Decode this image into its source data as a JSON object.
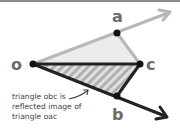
{
  "diagram": {
    "colors": {
      "background": "#ffffff",
      "top_bar": "#8a8a8a",
      "light_line": "#b8b8b8",
      "dark_line": "#222222",
      "upper_fill": "#ececec",
      "hatch_light": "#e0e0e0",
      "hatch_dark": "#b0b0b0",
      "label": "#6b6b6b",
      "caption": "#444444"
    },
    "points": [
      {
        "id": "o",
        "label": "o",
        "x": 33,
        "y": 64
      },
      {
        "id": "a",
        "label": "a",
        "x": 117,
        "y": 33
      },
      {
        "id": "c",
        "label": "c",
        "x": 140,
        "y": 64
      },
      {
        "id": "b",
        "label": "b",
        "x": 117,
        "y": 96
      }
    ],
    "rays": [
      {
        "id": "ray-oa",
        "from": "o",
        "through": "a",
        "tip": [
          170,
          12
        ],
        "style": "light"
      },
      {
        "id": "ray-ob",
        "from": "o",
        "through": "b",
        "tip": [
          167,
          117
        ],
        "style": "dark"
      }
    ],
    "triangles": [
      {
        "id": "oac",
        "vertices": [
          "o",
          "a",
          "c"
        ],
        "fill": "solid-light"
      },
      {
        "id": "obc",
        "vertices": [
          "o",
          "b",
          "c"
        ],
        "fill": "hatched"
      }
    ],
    "caption": {
      "lines": [
        "triangle obc is",
        "reflected image of",
        "triangle oac"
      ]
    },
    "labels": {
      "o": "o",
      "a": "a",
      "b": "b",
      "c": "c"
    }
  }
}
